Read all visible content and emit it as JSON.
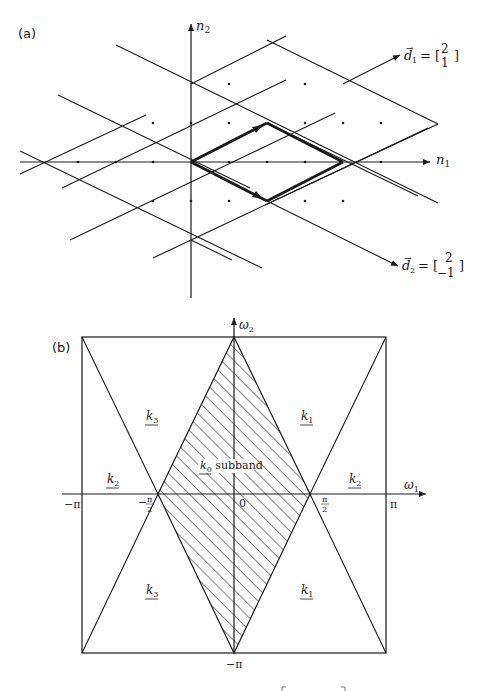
{
  "panel_a": {
    "label": "(a)",
    "axis_x_label": "n",
    "axis_x_sub": "1",
    "axis_y_label": "n",
    "axis_y_sub": "2",
    "d1": {
      "name": "d",
      "sub": "1",
      "eq": "= [",
      "top": "2",
      "bottom": "1",
      "close": "]"
    },
    "d2": {
      "name": "d",
      "sub": "2",
      "eq": "= [",
      "top": "2",
      "bottom": "−1",
      "close": "]"
    }
  },
  "panel_b": {
    "label": "(b)",
    "axis_x_label": "ω",
    "axis_x_sub": "1",
    "axis_y_label": "ω",
    "axis_y_sub": "2",
    "tick_neg_pi": "−π",
    "tick_pi": "π",
    "tick_neg_half_num": "π",
    "tick_neg_half_den": "2",
    "tick_neg_sign": "−",
    "tick_half_num": "π",
    "tick_half_den": "2",
    "tick_zero": "0",
    "tick_bottom": "−π",
    "regions": {
      "k0": "k",
      "k0_sub": "0",
      "k0_suffix": " subband",
      "k1_top": "k",
      "k1_top_sub": "1",
      "k1_bottom": "k",
      "k1_bottom_sub": "1",
      "k2_left": "k",
      "k2_left_sub": "2",
      "k2_right": "k",
      "k2_right_sub": "2",
      "k3_top": "k",
      "k3_top_sub": "3",
      "k3_bottom": "k",
      "k3_bottom_sub": "3"
    }
  },
  "colors": {
    "ink": "#1a1a1a",
    "background": "#ffffff"
  }
}
